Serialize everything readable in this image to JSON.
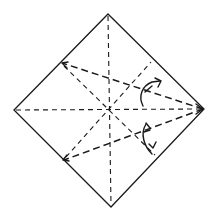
{
  "diagram": {
    "type": "origami-crease-pattern",
    "colors": {
      "ink": "#1a1a1a",
      "background": "#ffffff"
    },
    "vertices": {
      "top": [
        108,
        14
      ],
      "right": [
        204,
        109
      ],
      "bottom": [
        111,
        207
      ],
      "left": [
        14,
        110
      ],
      "center": [
        108,
        109
      ]
    },
    "fold_lines": [
      {
        "name": "upper-valley-fold",
        "from": [
          204,
          109
        ],
        "to": [
          61,
          63
        ],
        "style": "valley"
      },
      {
        "name": "lower-valley-fold",
        "from": [
          204,
          109
        ],
        "to": [
          63,
          160
        ],
        "style": "valley"
      }
    ],
    "crease_lines": [
      {
        "name": "vertical-crease",
        "from": [
          108,
          14
        ],
        "to": [
          111,
          207
        ]
      },
      {
        "name": "horizontal-crease",
        "from": [
          14,
          110
        ],
        "to": [
          204,
          109
        ]
      },
      {
        "name": "diagonal-crease-1",
        "from": [
          61,
          63
        ],
        "to": [
          157,
          157
        ]
      },
      {
        "name": "diagonal-crease-2",
        "from": [
          63,
          160
        ],
        "to": [
          153,
          60
        ]
      }
    ],
    "arrows": [
      {
        "name": "upper-fold-arrow",
        "direction": "up-right"
      },
      {
        "name": "lower-fold-arrow",
        "direction": "down-right"
      }
    ]
  }
}
